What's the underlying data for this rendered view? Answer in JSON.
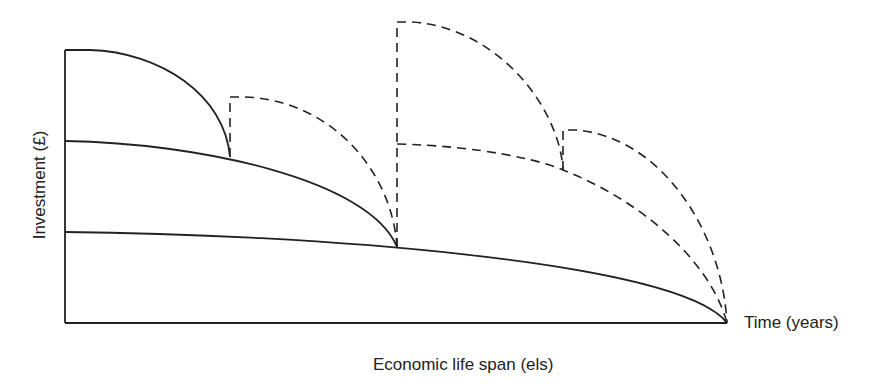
{
  "diagram": {
    "y_axis_label": "Investment (£)",
    "x_axis_label": "Time (years)",
    "caption": "Economic life span (els)",
    "line_color": "#222222",
    "curves": [
      {
        "name": "investment-1-short-life",
        "style": "solid",
        "start": [
          65,
          50
        ],
        "end": [
          230,
          157
        ]
      },
      {
        "name": "investment-2-medium-life",
        "style": "solid",
        "start": [
          65,
          141
        ],
        "end": [
          397,
          247
        ]
      },
      {
        "name": "investment-3-long-life",
        "style": "solid",
        "start": [
          65,
          232
        ],
        "end": [
          727,
          323
        ]
      },
      {
        "name": "reinvestment-1a",
        "style": "dashed",
        "start": [
          230,
          97
        ],
        "end": [
          397,
          247
        ]
      },
      {
        "name": "reinvestment-1b",
        "style": "dashed",
        "start": [
          397,
          22
        ],
        "end": [
          563,
          170
        ]
      },
      {
        "name": "reinvestment-2",
        "style": "dashed",
        "start": [
          397,
          144
        ],
        "end": [
          727,
          323
        ]
      },
      {
        "name": "reinvestment-1c",
        "style": "dashed",
        "start": [
          563,
          130
        ],
        "end": [
          727,
          323
        ]
      }
    ]
  }
}
